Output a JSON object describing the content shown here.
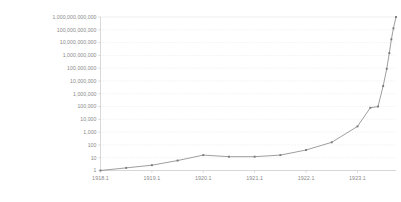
{
  "chart_data": {
    "type": "line",
    "title": "",
    "subtitle": "",
    "xlabel": "",
    "ylabel": "",
    "yscale": "log",
    "ylim": [
      1,
      1000000000000
    ],
    "xlim": [
      1918.1,
      1923.85
    ],
    "grid": true,
    "legend": false,
    "legend_position": "none",
    "ytick_labels": [
      "1,000,000,000,000",
      "100,000,000,000",
      "10,000,000,000",
      "1,000,000,000",
      "100,000,000",
      "10,000,000",
      "1,000,000",
      "100,000",
      "10,000",
      "1,000",
      "100",
      "10",
      "1"
    ],
    "ytick_values": [
      1000000000000,
      100000000000,
      10000000000,
      1000000000,
      100000000,
      10000000,
      1000000,
      100000,
      10000,
      1000,
      100,
      10,
      1
    ],
    "xtick_labels": [
      "1918.1",
      "1919.1",
      "1920.1",
      "1921.1",
      "1922.1",
      "1923.1"
    ],
    "xtick_values": [
      1918.1,
      1919.1,
      1920.1,
      1921.1,
      1922.1,
      1923.1
    ],
    "series": [
      {
        "name": "Price index",
        "color": "#8d8d8d",
        "marker": "dot",
        "x": [
          1918.1,
          1918.6,
          1919.1,
          1919.6,
          1920.1,
          1920.6,
          1921.1,
          1921.6,
          1922.1,
          1922.6,
          1923.1,
          1923.35,
          1923.5,
          1923.6,
          1923.67,
          1923.72,
          1923.76,
          1923.8,
          1923.85
        ],
        "y": [
          1,
          1.6,
          2.6,
          6,
          16,
          12,
          12,
          16,
          40,
          160,
          2800,
          80000,
          100000,
          4000000,
          90000000,
          1500000000,
          18000000000,
          130000000000,
          1000000000000
        ]
      }
    ]
  }
}
